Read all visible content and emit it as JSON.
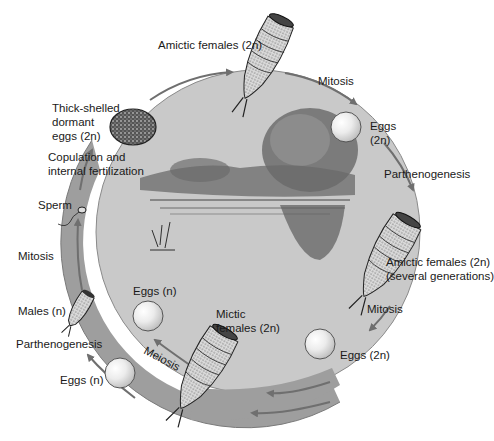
{
  "diagram": {
    "colors": {
      "background": "#ffffff",
      "inner_circle": "#c9c9c9",
      "outer_band": "#9e9e9e",
      "arrow": "#6f6f6f",
      "text": "#1a1a1a",
      "egg_fill": "#f2f2f2",
      "dormant_egg": "#3a3a3a"
    },
    "labels": {
      "amictic_females_top": "Amictic females (2n)",
      "mitosis_top_right": "Mitosis",
      "eggs_2n_top_line1": "Eggs",
      "eggs_2n_top_line2": "(2n)",
      "parthenogenesis_right": "Parthenogenesis",
      "amictic_females_right_line1": "Amictic  females (2n)",
      "amictic_females_right_line2": "(several generations)",
      "mitosis_bottom_right": "Mitosis",
      "eggs_2n_bottom": "Eggs (2n)",
      "parthenogenesis_bottom_band": "Parthenogenesis",
      "mictic_females_line1": "Mictic",
      "mictic_females_line2": "females (2n)",
      "meiosis_band": "Meiosis",
      "eggs_n_inner": "Eggs (n)",
      "eggs_n_outer": "Eggs (n)",
      "parthenogenesis_left": "Parthenogenesis",
      "males": "Males (n)",
      "mitosis_left": "Mitosis",
      "sperm": "Sperm",
      "copulation_line1": "Copulation and",
      "copulation_line2": "internal fertilization",
      "dormant_line1": "Thick-shelled",
      "dormant_line2": "dormant",
      "dormant_line3": "eggs (2n)"
    },
    "stages": [
      {
        "id": "amictic-female-top",
        "icon": "rotifer-female-icon"
      },
      {
        "id": "eggs-2n-top",
        "icon": "egg-icon"
      },
      {
        "id": "amictic-female-right",
        "icon": "rotifer-female-icon"
      },
      {
        "id": "eggs-2n-bottom",
        "icon": "egg-icon"
      },
      {
        "id": "mictic-female",
        "icon": "rotifer-female-icon"
      },
      {
        "id": "eggs-n-inner",
        "icon": "egg-icon"
      },
      {
        "id": "eggs-n-outer",
        "icon": "egg-icon"
      },
      {
        "id": "male",
        "icon": "rotifer-male-icon"
      },
      {
        "id": "sperm",
        "icon": "sperm-icon"
      },
      {
        "id": "dormant-eggs",
        "icon": "dormant-egg-icon"
      }
    ],
    "center_illustration": "pond-scene"
  }
}
